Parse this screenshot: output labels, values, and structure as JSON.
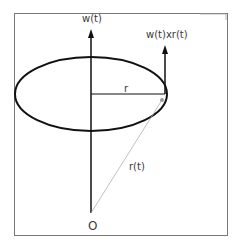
{
  "diagram": {
    "labels": {
      "angular_velocity": "w(t)",
      "cross_product": "w(t)xr(t)",
      "radius": "r",
      "position_vector": "r(t)",
      "origin": "O"
    },
    "colors": {
      "stroke": "#111111",
      "position_line": "#b0b0b0",
      "frame": "#777777",
      "text": "#3a3a3a"
    }
  }
}
